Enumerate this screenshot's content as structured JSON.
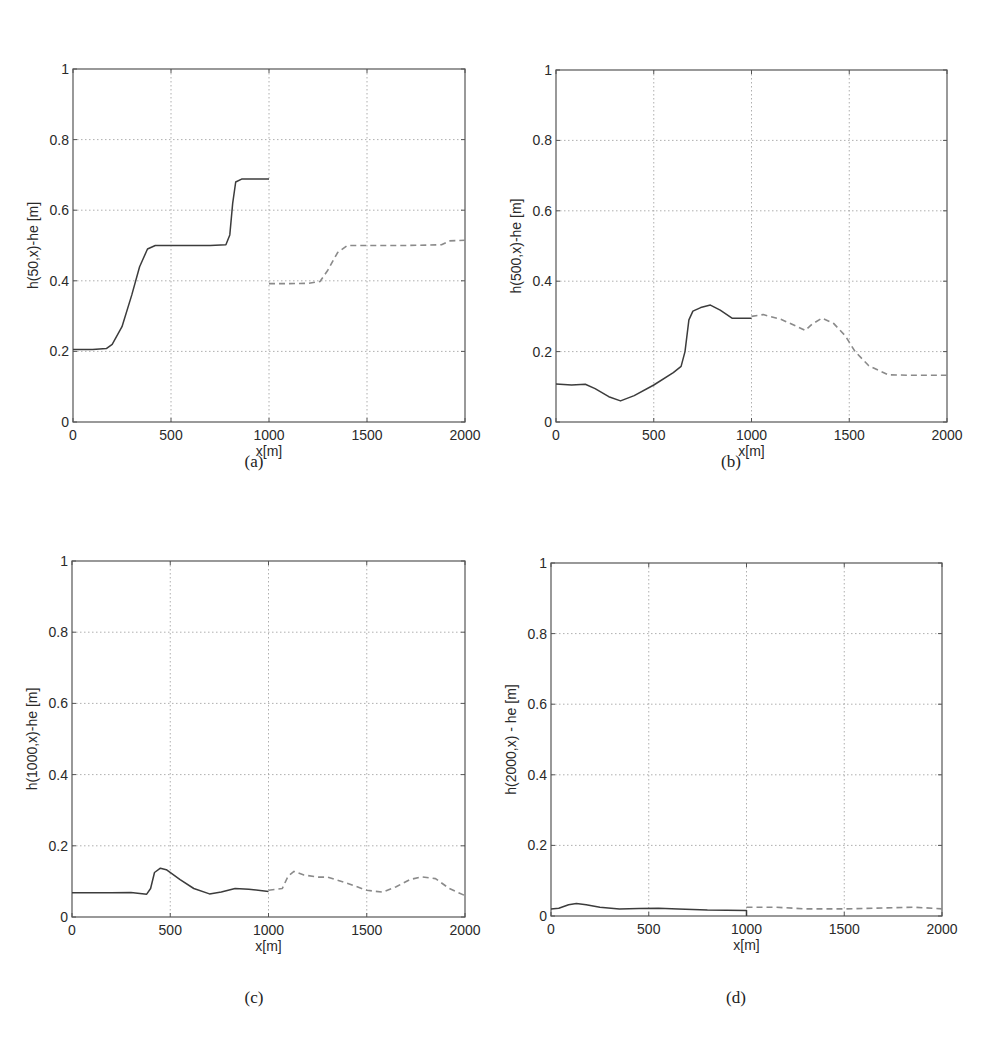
{
  "figure": {
    "captions": [
      "(a)",
      "(b)",
      "(c)",
      "(d)"
    ]
  },
  "style": {
    "axis_color": "#555555",
    "grid_color": "#9a9a9a",
    "solid_line_color": "#3c3c3c",
    "dashed_line_color": "#8a8a8a",
    "background": "#ffffff"
  },
  "chart_data": [
    {
      "type": "line",
      "panel": "(a)",
      "title": "",
      "xlabel": "x[m]",
      "ylabel": "h(50,x)-he [m]",
      "xlim": [
        0,
        2000
      ],
      "ylim": [
        0,
        1
      ],
      "xticks": [
        0,
        500,
        1000,
        1500,
        2000
      ],
      "yticks": [
        0,
        0.2,
        0.4,
        0.6,
        0.8,
        1
      ],
      "ytick_labels": [
        "0",
        "0.2",
        "0.4",
        "0.6",
        "0.8",
        "1"
      ],
      "grid": true,
      "legend": null,
      "series": [
        {
          "name": "solid",
          "style": "solid",
          "x": [
            0,
            100,
            170,
            200,
            250,
            300,
            340,
            380,
            420,
            500,
            600,
            700,
            780,
            800,
            815,
            830,
            860,
            1000
          ],
          "y": [
            0.205,
            0.205,
            0.208,
            0.22,
            0.27,
            0.36,
            0.44,
            0.49,
            0.5,
            0.5,
            0.5,
            0.5,
            0.502,
            0.53,
            0.62,
            0.68,
            0.688,
            0.688
          ]
        },
        {
          "name": "dashed",
          "style": "dashed",
          "x": [
            1000,
            1100,
            1200,
            1260,
            1300,
            1350,
            1400,
            1500,
            1700,
            1880,
            1920,
            2000
          ],
          "y": [
            0.392,
            0.392,
            0.393,
            0.398,
            0.43,
            0.48,
            0.5,
            0.5,
            0.5,
            0.502,
            0.513,
            0.515
          ]
        }
      ]
    },
    {
      "type": "line",
      "panel": "(b)",
      "title": "",
      "xlabel": "x[m]",
      "ylabel": "h(500,x)-he [m]",
      "xlim": [
        0,
        2000
      ],
      "ylim": [
        0,
        1
      ],
      "xticks": [
        0,
        500,
        1000,
        1500,
        2000
      ],
      "yticks": [
        0,
        0.2,
        0.4,
        0.6,
        0.8,
        1
      ],
      "ytick_labels": [
        "0",
        "0.2",
        "0.4",
        "0.6",
        "0.8",
        "1"
      ],
      "grid": true,
      "legend": null,
      "series": [
        {
          "name": "solid",
          "style": "solid",
          "x": [
            0,
            80,
            150,
            200,
            270,
            330,
            400,
            500,
            600,
            640,
            660,
            680,
            700,
            740,
            790,
            840,
            900,
            1000
          ],
          "y": [
            0.108,
            0.105,
            0.107,
            0.095,
            0.072,
            0.06,
            0.075,
            0.105,
            0.14,
            0.158,
            0.2,
            0.29,
            0.315,
            0.325,
            0.332,
            0.318,
            0.295,
            0.295
          ]
        },
        {
          "name": "dashed",
          "style": "dashed",
          "x": [
            1000,
            1060,
            1150,
            1230,
            1275,
            1310,
            1360,
            1420,
            1480,
            1530,
            1600,
            1700,
            1800,
            2000
          ],
          "y": [
            0.3,
            0.305,
            0.292,
            0.272,
            0.26,
            0.278,
            0.295,
            0.28,
            0.245,
            0.2,
            0.16,
            0.134,
            0.133,
            0.133
          ]
        }
      ]
    },
    {
      "type": "line",
      "panel": "(c)",
      "title": "",
      "xlabel": "x[m]",
      "ylabel": "h(1000,x)-he [m]",
      "xlim": [
        0,
        2000
      ],
      "ylim": [
        0,
        1
      ],
      "xticks": [
        0,
        500,
        1000,
        1500,
        2000
      ],
      "yticks": [
        0,
        0.2,
        0.4,
        0.6,
        0.8,
        1
      ],
      "ytick_labels": [
        "0",
        "0.2",
        "0.4",
        "0.6",
        "0.8",
        "1"
      ],
      "grid": true,
      "legend": null,
      "series": [
        {
          "name": "solid",
          "style": "solid",
          "x": [
            0,
            200,
            300,
            380,
            400,
            420,
            450,
            480,
            550,
            620,
            700,
            760,
            830,
            900,
            1000
          ],
          "y": [
            0.068,
            0.068,
            0.069,
            0.064,
            0.08,
            0.125,
            0.137,
            0.133,
            0.105,
            0.08,
            0.065,
            0.07,
            0.08,
            0.078,
            0.072
          ]
        },
        {
          "name": "dashed",
          "style": "dashed",
          "x": [
            1000,
            1070,
            1100,
            1130,
            1180,
            1250,
            1300,
            1400,
            1500,
            1580,
            1650,
            1720,
            1780,
            1850,
            1920,
            2000
          ],
          "y": [
            0.075,
            0.08,
            0.115,
            0.128,
            0.118,
            0.112,
            0.112,
            0.095,
            0.075,
            0.07,
            0.085,
            0.105,
            0.113,
            0.108,
            0.08,
            0.06
          ]
        }
      ]
    },
    {
      "type": "line",
      "panel": "(d)",
      "title": "",
      "xlabel": "x[m]",
      "ylabel": "h(2000,x) - he [m]",
      "xlim": [
        0,
        2000
      ],
      "ylim": [
        0,
        1
      ],
      "xticks": [
        0,
        500,
        1000,
        1500,
        2000
      ],
      "yticks": [
        0,
        0.2,
        0.4,
        0.6,
        0.8,
        1
      ],
      "ytick_labels": [
        "0",
        "0.2",
        "0.4",
        "0.6",
        "0.8",
        "1"
      ],
      "grid": true,
      "legend": null,
      "series": [
        {
          "name": "solid",
          "style": "solid",
          "x": [
            0,
            40,
            90,
            130,
            180,
            250,
            350,
            450,
            550,
            650,
            800,
            1000,
            1000
          ],
          "y": [
            0.02,
            0.022,
            0.032,
            0.035,
            0.032,
            0.025,
            0.02,
            0.021,
            0.022,
            0.02,
            0.017,
            0.016,
            0.0
          ]
        },
        {
          "name": "dashed",
          "style": "dashed",
          "x": [
            1000,
            1150,
            1300,
            1500,
            1650,
            1850,
            1950,
            2000
          ],
          "y": [
            0.025,
            0.025,
            0.02,
            0.02,
            0.022,
            0.025,
            0.022,
            0.02
          ]
        }
      ]
    }
  ],
  "layout": {
    "panels": [
      {
        "left": 73,
        "top": 69,
        "right": 465,
        "bottom": 422,
        "caption_x": 251,
        "caption_y": 466
      },
      {
        "left": 556,
        "top": 70,
        "right": 947,
        "bottom": 422,
        "caption_x": 728,
        "caption_y": 466
      },
      {
        "left": 72,
        "top": 561,
        "right": 465,
        "bottom": 917,
        "caption_x": 251,
        "caption_y": 1000
      },
      {
        "left": 551,
        "top": 563,
        "right": 942,
        "bottom": 916,
        "caption_x": 733,
        "caption_y": 1000
      }
    ]
  }
}
